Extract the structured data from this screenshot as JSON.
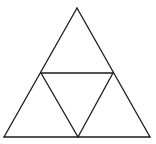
{
  "diagram": {
    "title": "",
    "stroke_color": "#1a1a1a",
    "background": "#ffffff",
    "vertices": {
      "apex": [
        77,
        8
      ],
      "bottom_left": [
        4,
        137
      ],
      "bottom_right": [
        150,
        137
      ],
      "mid_left": [
        41,
        73
      ],
      "mid_right": [
        113,
        73
      ],
      "mid_bottom": [
        78,
        137
      ]
    },
    "segments": [
      {
        "name": "outer-left-edge",
        "from": "apex",
        "to": "bottom_left"
      },
      {
        "name": "outer-right-edge",
        "from": "apex",
        "to": "bottom_right"
      },
      {
        "name": "outer-base-edge",
        "from": "bottom_left",
        "to": "bottom_right"
      },
      {
        "name": "inner-top-edge",
        "from": "mid_left",
        "to": "mid_right"
      },
      {
        "name": "inner-left-edge",
        "from": "mid_left",
        "to": "mid_bottom"
      },
      {
        "name": "inner-right-edge",
        "from": "mid_right",
        "to": "mid_bottom"
      }
    ]
  }
}
